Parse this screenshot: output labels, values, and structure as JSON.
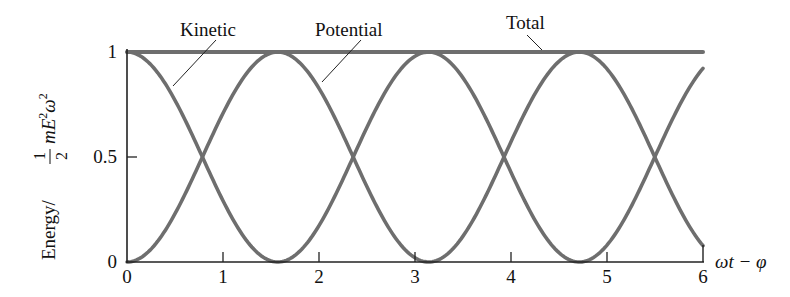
{
  "chart_data": {
    "type": "line",
    "title": "",
    "xlabel": "ωt − φ",
    "ylabel": "Energy/ (1/2) m E² ω²",
    "ylabel_parts": {
      "prefix": "Energy/",
      "frac_num": "1",
      "frac_den": "2",
      "rest": "mE",
      "sup1": "2",
      "omega": "ω",
      "sup2": "2"
    },
    "xlim": [
      0,
      6
    ],
    "ylim": [
      0,
      1
    ],
    "xticks": [
      0,
      1,
      2,
      3,
      4,
      5,
      6
    ],
    "xtick_labels": [
      "0",
      "1",
      "2",
      "3",
      "4",
      "5",
      "6"
    ],
    "yticks": [
      0,
      0.5,
      1
    ],
    "ytick_labels": [
      "0",
      "0.5",
      "1"
    ],
    "x_origin_label": "0",
    "grid": false,
    "legend": "none (curves labeled directly with leader lines)",
    "series": [
      {
        "name": "Kinetic",
        "function": "cos^2(x)",
        "x": [
          0,
          0.5,
          0.785,
          1.0,
          1.571,
          2.0,
          2.356,
          2.5,
          3.0,
          3.142,
          3.5,
          3.927,
          4.0,
          4.5,
          4.712,
          5.0,
          5.498,
          5.5,
          6.0
        ],
        "values": [
          1.0,
          0.77,
          0.5,
          0.29,
          0.0,
          0.17,
          0.5,
          0.64,
          0.98,
          1.0,
          0.87,
          0.5,
          0.43,
          0.05,
          0.0,
          0.08,
          0.5,
          0.51,
          0.92
        ]
      },
      {
        "name": "Potential",
        "function": "sin^2(x)",
        "x": [
          0,
          0.5,
          0.785,
          1.0,
          1.571,
          2.0,
          2.356,
          2.5,
          3.0,
          3.142,
          3.5,
          3.927,
          4.0,
          4.5,
          4.712,
          5.0,
          5.498,
          5.5,
          6.0
        ],
        "values": [
          0.0,
          0.23,
          0.5,
          0.71,
          1.0,
          0.83,
          0.5,
          0.36,
          0.02,
          0.0,
          0.13,
          0.5,
          0.57,
          0.95,
          1.0,
          0.92,
          0.5,
          0.49,
          0.08
        ]
      },
      {
        "name": "Total",
        "function": "1",
        "x": [
          0,
          6
        ],
        "values": [
          1.0,
          1.0
        ]
      }
    ],
    "annotations": [
      {
        "text": "Kinetic",
        "points_to": "Kinetic curve near x≈0.45"
      },
      {
        "text": "Potential",
        "points_to": "Potential curve near x≈1.9"
      },
      {
        "text": "Total",
        "points_to": "Total line near x≈3.7"
      }
    ],
    "colors": {
      "curves": "#6e6e6e",
      "axes": "#222222",
      "text": "#111111",
      "background": "#ffffff"
    }
  }
}
